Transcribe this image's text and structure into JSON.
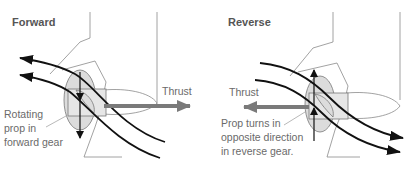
{
  "panels": [
    {
      "id": "forward",
      "title": "Forward",
      "thrust_label": "Thrust",
      "thrust_direction": "right",
      "caption_lines": [
        "Rotating",
        "prop in",
        "forward gear"
      ]
    },
    {
      "id": "reverse",
      "title": "Reverse",
      "thrust_label": "Thrust",
      "thrust_direction": "left",
      "caption_lines": [
        "Prop turns in",
        "opposite direction",
        "in reverse gear."
      ]
    }
  ],
  "colors": {
    "flow_arrows": "#111111",
    "thrust_arrow": "#7a7a7a",
    "outline": "#8a8a8a",
    "prop_fill": "#dcdcdc",
    "text": "#6a6a6a"
  }
}
